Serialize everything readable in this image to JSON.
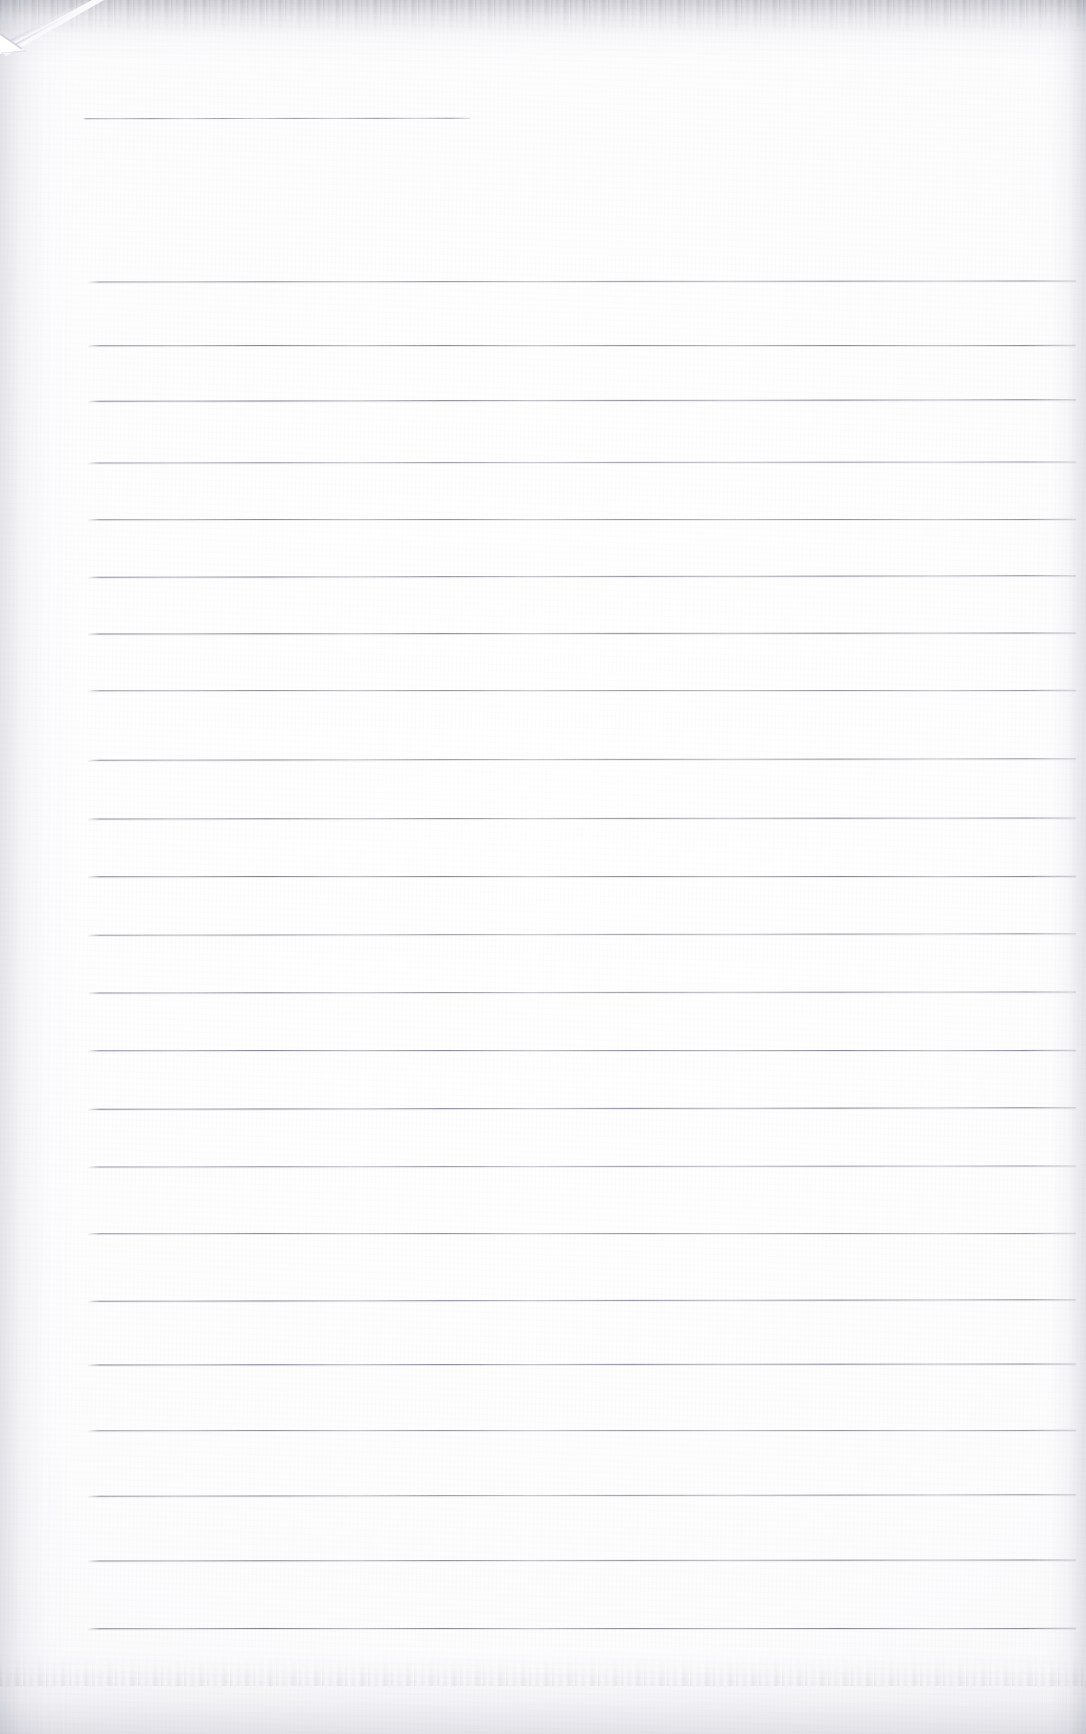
{
  "document": {
    "type": "scanned-ruled-paper",
    "title": "",
    "page_width": 1086,
    "page_height": 1734,
    "background_color": "#ffffff",
    "rule_color": "#78788a",
    "edge_shadow_color": "#d2d2da",
    "content_text": "",
    "is_blank": true
  },
  "paper": {
    "left_margin_x": 88,
    "right_margin_x": 1076,
    "fold": {
      "name": "folded-top-left-corner",
      "from_x": 0,
      "from_y": 48,
      "to_x": 92,
      "to_y": 0
    }
  },
  "header_rule": {
    "label": "title-rule",
    "y": 118,
    "x_start": 82,
    "x_end": 470
  },
  "ruled_lines": [
    {
      "index": 1,
      "y": 281,
      "x_start": 88,
      "x_end": 1076
    },
    {
      "index": 2,
      "y": 345,
      "x_start": 88,
      "x_end": 1076
    },
    {
      "index": 3,
      "y": 400,
      "x_start": 88,
      "x_end": 1076
    },
    {
      "index": 4,
      "y": 462,
      "x_start": 88,
      "x_end": 1076
    },
    {
      "index": 5,
      "y": 519,
      "x_start": 88,
      "x_end": 1076
    },
    {
      "index": 6,
      "y": 576,
      "x_start": 88,
      "x_end": 1076
    },
    {
      "index": 7,
      "y": 633,
      "x_start": 88,
      "x_end": 1076
    },
    {
      "index": 8,
      "y": 690,
      "x_start": 88,
      "x_end": 1076
    },
    {
      "index": 9,
      "y": 759,
      "x_start": 88,
      "x_end": 1076
    },
    {
      "index": 10,
      "y": 818,
      "x_start": 88,
      "x_end": 1076
    },
    {
      "index": 11,
      "y": 876,
      "x_start": 88,
      "x_end": 1076
    },
    {
      "index": 12,
      "y": 934,
      "x_start": 88,
      "x_end": 1076
    },
    {
      "index": 13,
      "y": 992,
      "x_start": 88,
      "x_end": 1076
    },
    {
      "index": 14,
      "y": 1050,
      "x_start": 88,
      "x_end": 1076
    },
    {
      "index": 15,
      "y": 1108,
      "x_start": 88,
      "x_end": 1076
    },
    {
      "index": 16,
      "y": 1166,
      "x_start": 88,
      "x_end": 1076
    },
    {
      "index": 17,
      "y": 1233,
      "x_start": 88,
      "x_end": 1076
    },
    {
      "index": 18,
      "y": 1300,
      "x_start": 88,
      "x_end": 1076
    },
    {
      "index": 19,
      "y": 1364,
      "x_start": 88,
      "x_end": 1076
    },
    {
      "index": 20,
      "y": 1430,
      "x_start": 88,
      "x_end": 1076
    },
    {
      "index": 21,
      "y": 1495,
      "x_start": 88,
      "x_end": 1076
    },
    {
      "index": 22,
      "y": 1560,
      "x_start": 88,
      "x_end": 1076
    },
    {
      "index": 23,
      "y": 1628,
      "x_start": 88,
      "x_end": 1076
    }
  ]
}
